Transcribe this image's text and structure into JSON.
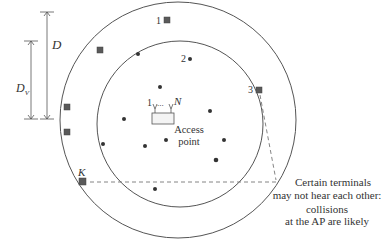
{
  "labels": {
    "outer_radius": "D",
    "inner_radius": "D",
    "inner_radius_sub": "V",
    "terminal_1": "1",
    "terminal_2": "2",
    "terminal_3": "3",
    "terminal_k": "K",
    "antenna_first": "1",
    "antenna_dots": "...",
    "antenna_last": "N",
    "access_point_line1": "Access",
    "access_point_line2": "point"
  },
  "annotation": {
    "line1": "Certain terminals",
    "line2": "may not hear each other:",
    "line3": "collisions",
    "line4": "at the AP are likely"
  },
  "colors": {
    "line": "#555555",
    "terminal": "#5a5a5a",
    "dot": "#333333"
  }
}
